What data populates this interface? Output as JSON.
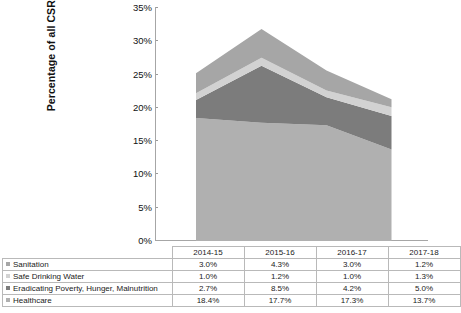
{
  "chart_data": {
    "type": "area",
    "stacked": true,
    "title": "",
    "xlabel": "",
    "ylabel": "Percentage of all CSR Investments",
    "categories": [
      "2014-15",
      "2015-16",
      "2016-17",
      "2017-18"
    ],
    "ylim": [
      0,
      35
    ],
    "ytick_labels": [
      "0%",
      "5%",
      "10%",
      "15%",
      "20%",
      "25%",
      "30%",
      "35%"
    ],
    "ytick_values": [
      0,
      5,
      10,
      15,
      20,
      25,
      30,
      35
    ],
    "grid": false,
    "legend_position": "table-row-labels",
    "series": [
      {
        "name": "Sanitation",
        "values": [
          3.0,
          4.3,
          3.0,
          1.2
        ],
        "labels": [
          "3.0%",
          "4.3%",
          "3.0%",
          "1.2%"
        ],
        "color": "#a6a6a6",
        "stack_order": 4
      },
      {
        "name": "Safe Drinking Water",
        "values": [
          1.0,
          1.2,
          1.0,
          1.3
        ],
        "labels": [
          "1.0%",
          "1.2%",
          "1.0%",
          "1.3%"
        ],
        "color": "#d2d2d2",
        "stack_order": 3
      },
      {
        "name": "Eradicating Poverty, Hunger, Malnutrition",
        "values": [
          2.7,
          8.5,
          4.2,
          5.0
        ],
        "labels": [
          "2.7%",
          "8.5%",
          "4.2%",
          "5.0%"
        ],
        "color": "#7c7c7c",
        "stack_order": 2
      },
      {
        "name": "Healthcare",
        "values": [
          18.4,
          17.7,
          17.3,
          13.7
        ],
        "labels": [
          "18.4%",
          "17.7%",
          "17.3%",
          "13.7%"
        ],
        "color": "#b0b0b0",
        "stack_order": 1
      }
    ],
    "totals": [
      25.1,
      31.7,
      25.5,
      21.2
    ]
  },
  "table": {
    "header_corner": "",
    "columns": [
      "2014-15",
      "2015-16",
      "2016-17",
      "2017-18"
    ],
    "rows": [
      {
        "label": "Sanitation",
        "marker_color": "#a6a6a6",
        "values": [
          "3.0%",
          "4.3%",
          "3.0%",
          "1.2%"
        ]
      },
      {
        "label": "Safe Drinking Water",
        "marker_color": "#d2d2d2",
        "values": [
          "1.0%",
          "1.2%",
          "1.0%",
          "1.3%"
        ]
      },
      {
        "label": "Eradicating Poverty, Hunger, Malnutrition",
        "marker_color": "#7c7c7c",
        "values": [
          "2.7%",
          "8.5%",
          "4.2%",
          "5.0%"
        ]
      },
      {
        "label": "Healthcare",
        "marker_color": "#b0b0b0",
        "values": [
          "18.4%",
          "17.7%",
          "17.3%",
          "13.7%"
        ]
      }
    ]
  }
}
